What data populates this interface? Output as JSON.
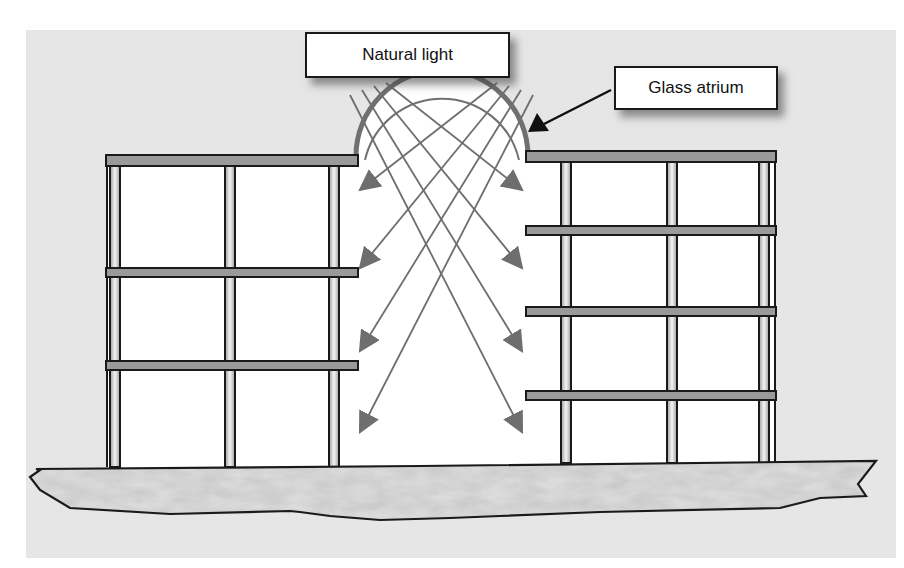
{
  "figure": {
    "type": "architecture-schematic",
    "labels": {
      "natural_light": "Natural light",
      "glass_atrium": "Glass atrium"
    },
    "colors": {
      "page_background": "#ffffff",
      "panel_background": "#e6e6e6",
      "floor_slab_fill": "#9a9a9a",
      "outline": "#1a1a1a",
      "ray": "#6e6e6e",
      "dome": "#707070",
      "ground_fill": "#dcdcdc",
      "interior": "#ffffff",
      "callout_arrow": "#111111"
    },
    "panel": {
      "x": 26,
      "y": 30,
      "w": 870,
      "h": 528
    },
    "label_boxes": {
      "natural_light": {
        "x": 305,
        "y": 32,
        "w": 205,
        "h": 46
      },
      "glass_atrium": {
        "x": 614,
        "y": 66,
        "w": 164,
        "h": 44
      }
    },
    "callout": {
      "from": [
        611,
        90
      ],
      "to": [
        528,
        132
      ]
    },
    "left_building": {
      "roof": {
        "x": 106,
        "y": 155,
        "w": 252,
        "h": 11
      },
      "floors": [
        {
          "x": 106,
          "y": 268,
          "w": 252,
          "h": 9
        },
        {
          "x": 106,
          "y": 361,
          "w": 252,
          "h": 9
        }
      ],
      "columns_x": [
        115,
        230,
        334
      ],
      "wall_x": 107,
      "column_top": 166,
      "column_bottom": 467
    },
    "right_building": {
      "roof": {
        "x": 526,
        "y": 151,
        "w": 250,
        "h": 11
      },
      "floors": [
        {
          "x": 526,
          "y": 226,
          "w": 250,
          "h": 9
        },
        {
          "x": 526,
          "y": 307,
          "w": 250,
          "h": 9
        },
        {
          "x": 526,
          "y": 391,
          "w": 250,
          "h": 9
        }
      ],
      "columns_x": [
        566,
        672,
        764
      ],
      "wall_x": 775,
      "column_top": 162,
      "column_bottom": 463
    },
    "atrium": {
      "dome_center": [
        442,
        156
      ],
      "dome_outer_r": 86,
      "dome_inner_r": 79
    },
    "light_rays": [
      {
        "from": [
          350,
          95
        ],
        "to": [
          522,
          432
        ]
      },
      {
        "from": [
          362,
          90
        ],
        "to": [
          522,
          351
        ]
      },
      {
        "from": [
          374,
          86
        ],
        "to": [
          522,
          268
        ]
      },
      {
        "from": [
          386,
          83
        ],
        "to": [
          522,
          190
        ]
      },
      {
        "from": [
          497,
          83
        ],
        "to": [
          360,
          190
        ]
      },
      {
        "from": [
          509,
          86
        ],
        "to": [
          360,
          268
        ]
      },
      {
        "from": [
          521,
          90
        ],
        "to": [
          360,
          351
        ]
      },
      {
        "from": [
          533,
          95
        ],
        "to": [
          360,
          432
        ]
      }
    ],
    "ground": {
      "points": [
        [
          40,
          470
        ],
        [
          30,
          477
        ],
        [
          40,
          490
        ],
        [
          70,
          508
        ],
        [
          170,
          514
        ],
        [
          290,
          511
        ],
        [
          300,
          512
        ],
        [
          330,
          516
        ],
        [
          380,
          520
        ],
        [
          450,
          518
        ],
        [
          500,
          516
        ],
        [
          600,
          512
        ],
        [
          780,
          508
        ],
        [
          820,
          498
        ],
        [
          866,
          496
        ],
        [
          858,
          484
        ],
        [
          876,
          461
        ],
        [
          420,
          466
        ],
        [
          36,
          469
        ]
      ]
    }
  }
}
